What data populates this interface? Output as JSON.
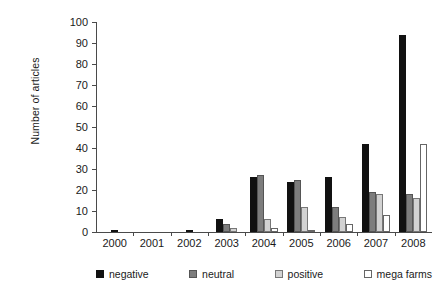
{
  "chart_data": {
    "type": "bar",
    "title": "",
    "subtitle": "",
    "xlabel": "",
    "ylabel": "Number of articles",
    "ylim": [
      0,
      100
    ],
    "ytick_step": 10,
    "yticks": [
      100,
      90,
      80,
      70,
      60,
      50,
      40,
      30,
      20,
      10,
      0
    ],
    "grid": false,
    "legend_position": "bottom",
    "categories": [
      "2000",
      "2001",
      "2002",
      "2003",
      "2004",
      "2005",
      "2006",
      "2007",
      "2008"
    ],
    "series": [
      {
        "name": "negative",
        "color": "#111111",
        "values": [
          1,
          0,
          1,
          6,
          26,
          24,
          26,
          42,
          94
        ]
      },
      {
        "name": "neutral",
        "color": "#7d7d7d",
        "values": [
          0,
          0,
          0,
          4,
          27,
          25,
          12,
          19,
          18
        ]
      },
      {
        "name": "positive",
        "color": "#d2d2d2",
        "values": [
          0,
          0,
          0,
          2,
          6,
          12,
          7,
          18,
          16
        ]
      },
      {
        "name": "mega farms",
        "color": "#ffffff",
        "values": [
          0,
          0,
          0,
          0,
          2,
          1,
          4,
          8,
          42
        ]
      }
    ]
  },
  "legend": {
    "items": [
      {
        "label": "negative"
      },
      {
        "label": "neutral"
      },
      {
        "label": "positive"
      },
      {
        "label": "mega farms"
      }
    ]
  }
}
